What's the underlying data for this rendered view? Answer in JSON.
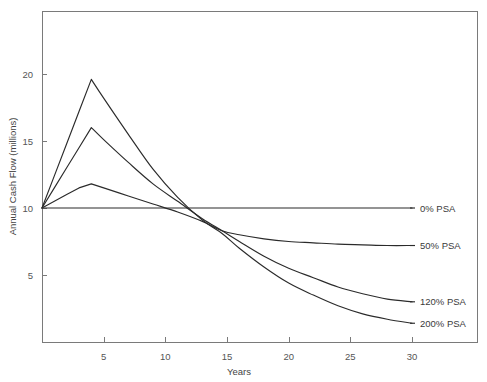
{
  "chart_data": {
    "type": "line",
    "title": "",
    "xlabel": "Years",
    "ylabel": "Annual Cash Flow (millions)",
    "xlim": [
      0,
      32
    ],
    "ylim": [
      0,
      24
    ],
    "grid": false,
    "legend_position": "right-inline",
    "xticks": [
      5,
      10,
      15,
      20,
      25,
      30
    ],
    "xtick_labels": [
      "5",
      "10",
      "15",
      "20",
      "25",
      "30"
    ],
    "yticks": [
      5,
      10,
      15,
      20
    ],
    "ytick_labels": [
      "5",
      "10",
      "15",
      "20"
    ],
    "series": [
      {
        "name": "0% PSA",
        "label": "0% PSA",
        "color": "#2b2b2b",
        "x": [
          0,
          5,
          10,
          15,
          20,
          25,
          30
        ],
        "values": [
          10.0,
          10.0,
          10.0,
          10.0,
          10.0,
          10.0,
          10.0
        ]
      },
      {
        "name": "50% PSA",
        "label": "50% PSA",
        "color": "#2b2b2b",
        "x": [
          0,
          1,
          2,
          3,
          4,
          5,
          7,
          9,
          11,
          13,
          14.6,
          16,
          18,
          20,
          22,
          24,
          26,
          28,
          30
        ],
        "values": [
          10.0,
          10.5,
          11.0,
          11.5,
          11.8,
          11.5,
          10.9,
          10.3,
          9.7,
          9.0,
          8.3,
          8.0,
          7.7,
          7.5,
          7.4,
          7.3,
          7.25,
          7.2,
          7.2
        ]
      },
      {
        "name": "120% PSA",
        "label": "120% PSA",
        "color": "#2b2b2b",
        "x": [
          0,
          1,
          2,
          3,
          4,
          5,
          7,
          9,
          11,
          13,
          14.6,
          16,
          18,
          20,
          22,
          24,
          26,
          28,
          30
        ],
        "values": [
          10.0,
          11.5,
          13.0,
          14.5,
          16.0,
          15.1,
          13.4,
          11.8,
          10.5,
          9.2,
          8.3,
          7.5,
          6.4,
          5.5,
          4.8,
          4.1,
          3.6,
          3.2,
          3.0
        ]
      },
      {
        "name": "200% PSA",
        "label": "200% PSA",
        "color": "#2b2b2b",
        "x": [
          0,
          1,
          2,
          3,
          4,
          5,
          7,
          9,
          11,
          13,
          14.6,
          16,
          18,
          20,
          22,
          24,
          26,
          28,
          30
        ],
        "values": [
          10.0,
          12.4,
          14.8,
          17.2,
          19.6,
          18.2,
          15.5,
          12.9,
          10.8,
          9.1,
          8.1,
          7.0,
          5.6,
          4.4,
          3.5,
          2.7,
          2.1,
          1.7,
          1.4
        ]
      }
    ],
    "series_label_positions": [
      {
        "label": "0% PSA",
        "y_value": 10.0
      },
      {
        "label": "50% PSA",
        "y_value": 7.2
      },
      {
        "label": "120% PSA",
        "y_value": 3.0
      },
      {
        "label": "200% PSA",
        "y_value": 1.4
      }
    ]
  }
}
